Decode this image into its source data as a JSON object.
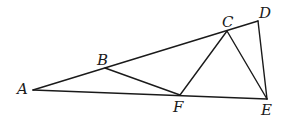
{
  "diagram": {
    "type": "geometry-figure",
    "points": {
      "A": {
        "label": "A",
        "x": 33,
        "y": 90,
        "lx": 17,
        "ly": 94
      },
      "B": {
        "label": "B",
        "x": 105,
        "y": 68,
        "lx": 97,
        "ly": 65
      },
      "C": {
        "label": "C",
        "x": 227,
        "y": 31,
        "lx": 222,
        "ly": 27
      },
      "D": {
        "label": "D",
        "x": 258,
        "y": 21,
        "lx": 259,
        "ly": 18
      },
      "E": {
        "label": "E",
        "x": 267,
        "y": 99,
        "lx": 261,
        "ly": 115
      },
      "F": {
        "label": "F",
        "x": 180,
        "y": 95,
        "lx": 173,
        "ly": 112
      }
    },
    "segments": [
      [
        "A",
        "D"
      ],
      [
        "A",
        "E"
      ],
      [
        "D",
        "E"
      ],
      [
        "B",
        "F"
      ],
      [
        "F",
        "C"
      ],
      [
        "C",
        "E"
      ]
    ],
    "line_color": "#1a1a1a"
  }
}
